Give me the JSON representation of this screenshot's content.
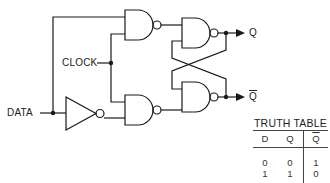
{
  "diagram": {
    "labels": {
      "clock": "CLOCK",
      "data": "DATA",
      "q": "Q",
      "q_bar": "Q"
    },
    "colors": {
      "line": "#1a1a1a",
      "background": "#ffffff"
    },
    "components": [
      {
        "id": "inverter",
        "type": "NOT"
      },
      {
        "id": "nand-1",
        "type": "NAND",
        "position": "top-left"
      },
      {
        "id": "nand-2",
        "type": "NAND",
        "position": "bottom-left"
      },
      {
        "id": "nand-3",
        "type": "NAND",
        "position": "top-right"
      },
      {
        "id": "nand-4",
        "type": "NAND",
        "position": "bottom-right"
      }
    ]
  },
  "truth_table": {
    "title": "TRUTH TABLE",
    "headers": [
      "D",
      "Q",
      "Q"
    ],
    "header_overbar": [
      false,
      false,
      true
    ],
    "rows": [
      [
        "0",
        "0",
        "1"
      ],
      [
        "1",
        "1",
        "0"
      ]
    ]
  }
}
